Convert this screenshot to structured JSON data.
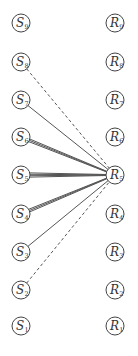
{
  "diagram": {
    "title": "",
    "left_column": {
      "letter": "S",
      "x": 21,
      "nodes": [
        {
          "id": "S9",
          "letter": "S",
          "sub": "9",
          "y": 23
        },
        {
          "id": "S8",
          "letter": "S",
          "sub": "8",
          "y": 62
        },
        {
          "id": "S7",
          "letter": "S",
          "sub": "7",
          "y": 100
        },
        {
          "id": "S6",
          "letter": "S",
          "sub": "6",
          "y": 137
        },
        {
          "id": "S5",
          "letter": "S",
          "sub": "5",
          "y": 175
        },
        {
          "id": "S4",
          "letter": "S",
          "sub": "4",
          "y": 214
        },
        {
          "id": "S3",
          "letter": "S",
          "sub": "3",
          "y": 252
        },
        {
          "id": "S2",
          "letter": "S",
          "sub": "2",
          "y": 290
        },
        {
          "id": "S1",
          "letter": "S",
          "sub": "1",
          "y": 326
        }
      ]
    },
    "right_column": {
      "letter": "R",
      "x": 115,
      "nodes": [
        {
          "id": "R9",
          "letter": "R",
          "sub": "9",
          "y": 23
        },
        {
          "id": "R8",
          "letter": "R",
          "sub": "8",
          "y": 62
        },
        {
          "id": "R7",
          "letter": "R",
          "sub": "7",
          "y": 100
        },
        {
          "id": "R6",
          "letter": "R",
          "sub": "6",
          "y": 137
        },
        {
          "id": "R5",
          "letter": "R",
          "sub": "5",
          "y": 175
        },
        {
          "id": "R4",
          "letter": "R",
          "sub": "4",
          "y": 214
        },
        {
          "id": "R3",
          "letter": "R",
          "sub": "3",
          "y": 252
        },
        {
          "id": "R2",
          "letter": "R",
          "sub": "2",
          "y": 290
        },
        {
          "id": "R1",
          "letter": "R",
          "sub": "1",
          "y": 326
        }
      ]
    },
    "node_radius": 9,
    "edges": [
      {
        "from": "S8",
        "to": "R5",
        "style": "dashed",
        "lines": 1
      },
      {
        "from": "S7",
        "to": "R5",
        "style": "solid",
        "lines": 1
      },
      {
        "from": "S6",
        "to": "R5",
        "style": "solid",
        "lines": 3
      },
      {
        "from": "S5",
        "to": "R5",
        "style": "solid",
        "lines": 4
      },
      {
        "from": "S4",
        "to": "R5",
        "style": "solid",
        "lines": 3
      },
      {
        "from": "S3",
        "to": "R5",
        "style": "solid",
        "lines": 1
      },
      {
        "from": "S2",
        "to": "R5",
        "style": "dashed",
        "lines": 1
      }
    ],
    "colors": {
      "stroke": "#444444",
      "edge": "#555555",
      "text": "#333333",
      "background": "#ffffff"
    }
  }
}
